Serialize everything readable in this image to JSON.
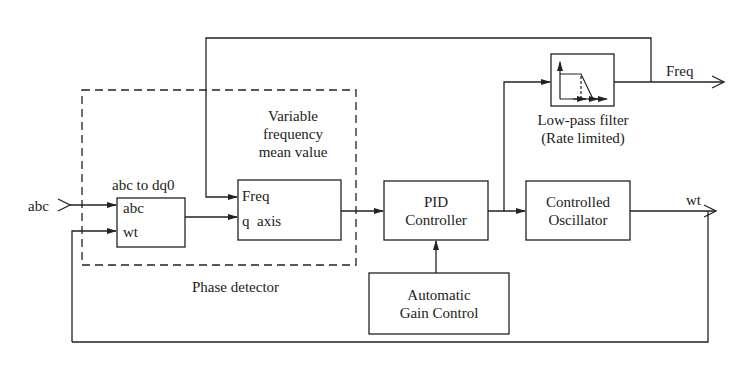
{
  "diagram": {
    "colors": {
      "line": "#222222",
      "background": "#ffffff"
    },
    "inputs": {
      "abc": "abc"
    },
    "outputs": {
      "freq": "Freq",
      "wt": "wt"
    },
    "groups": {
      "phase_detector": "Phase detector"
    },
    "blocks": {
      "abc_to_dq0": {
        "title": "abc to dq0",
        "ports": [
          "abc",
          "wt"
        ]
      },
      "variable_frequency_mean": {
        "title_lines": [
          "Variable",
          "frequency",
          "mean value"
        ],
        "ports": [
          "Freq",
          "q  axis"
        ]
      },
      "pid": {
        "lines": [
          "PID",
          "Controller"
        ]
      },
      "agc": {
        "lines": [
          "Automatic",
          "Gain Control"
        ]
      },
      "oscillator": {
        "lines": [
          "Controlled",
          "Oscillator"
        ]
      },
      "lowpass": {
        "caption_lines": [
          "Low-pass filter",
          "(Rate limited)"
        ],
        "icon": "lowpass-response-icon"
      }
    }
  }
}
